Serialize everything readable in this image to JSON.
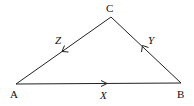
{
  "diagram": {
    "type": "triangle",
    "vertices": [
      {
        "id": "A",
        "label": "A",
        "x": 16,
        "y": 84
      },
      {
        "id": "B",
        "label": "B",
        "x": 181,
        "y": 83
      },
      {
        "id": "C",
        "label": "C",
        "x": 111,
        "y": 17
      }
    ],
    "edges": [
      {
        "from": "A",
        "to": "B",
        "label": "X",
        "arrow_direction": "A to B"
      },
      {
        "from": "B",
        "to": "C",
        "label": "Y",
        "arrow_direction": "B to C"
      },
      {
        "from": "C",
        "to": "A",
        "label": "Z",
        "arrow_direction": "C to A"
      }
    ],
    "labels": {
      "A": "A",
      "B": "B",
      "C": "C",
      "X": "X",
      "Y": "Y",
      "Z": "Z"
    },
    "colors": {
      "line": "#222222",
      "background": "#ffffff"
    }
  }
}
